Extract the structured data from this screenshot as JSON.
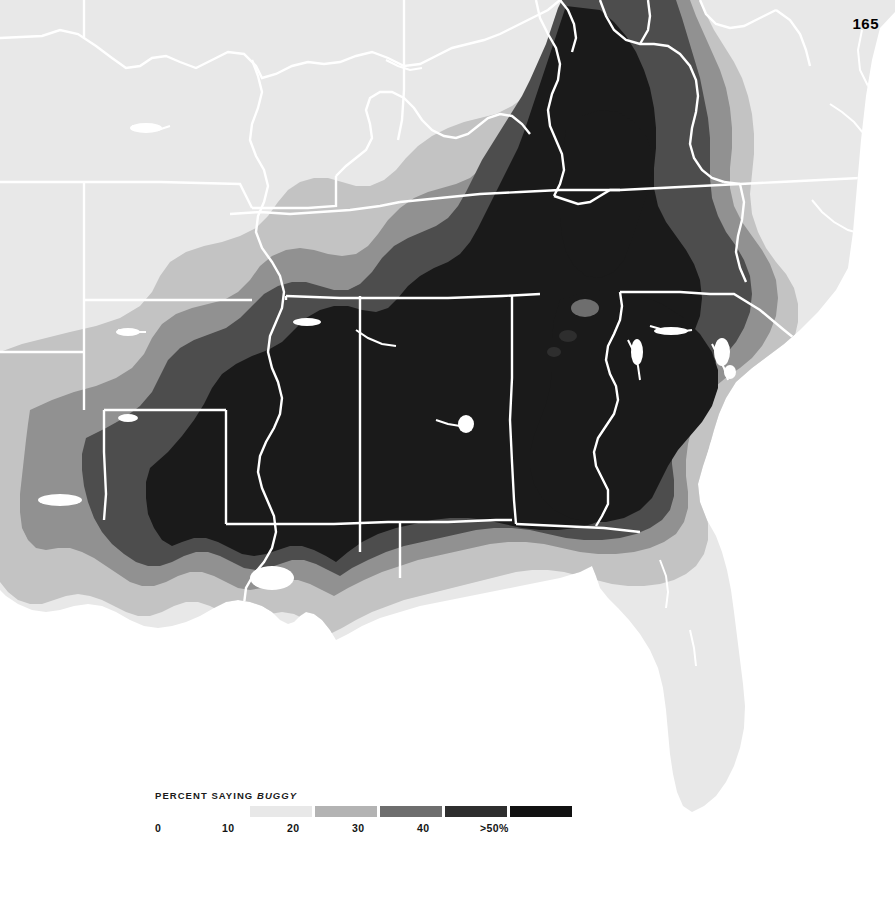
{
  "page": {
    "number": "165",
    "background_color": "#ffffff"
  },
  "map": {
    "name": "percent-saying-buggy-choropleth",
    "region": "Southeastern United States",
    "water_color": "#ffffff",
    "border_color": "#ffffff",
    "projection_note": "conic",
    "state_borders_visible": true
  },
  "legend": {
    "title_prefix": "PERCENT SAYING ",
    "title_keyword": "BUGGY",
    "title_full": "PERCENT SAYING BUGGY",
    "ticks": [
      {
        "label": "0",
        "x": 0
      },
      {
        "label": "10",
        "x": 67
      },
      {
        "label": "20",
        "x": 132
      },
      {
        "label": "30",
        "x": 197
      },
      {
        "label": "40",
        "x": 262
      },
      {
        "label": ">50%",
        "x": 325
      }
    ],
    "swatches": [
      {
        "label": "0-10",
        "color": "#e8e8e8"
      },
      {
        "label": "10-20",
        "color": "#b3b3b3"
      },
      {
        "label": "20-30",
        "color": "#6e6e6e"
      },
      {
        "label": "30-40",
        "color": "#2e2e2e"
      },
      {
        "label": ">50%",
        "color": "#111111"
      }
    ]
  },
  "chart_data": {
    "type": "heatmap",
    "title": "PERCENT SAYING BUGGY",
    "subtitle": "",
    "xlabel": "",
    "ylabel": "",
    "legend_position": "bottom-left",
    "grid": false,
    "units": "percent of respondents",
    "bins": [
      {
        "range": "0-10",
        "color": "#e8e8e8",
        "min": 0,
        "max": 10
      },
      {
        "range": "10-20",
        "color": "#b3b3b3",
        "min": 10,
        "max": 20
      },
      {
        "range": "20-30",
        "color": "#6e6e6e",
        "min": 20,
        "max": 30
      },
      {
        "range": "30-40",
        "color": "#2e2e2e",
        "min": 30,
        "max": 40
      },
      {
        "range": ">50",
        "color": "#111111",
        "min": 50,
        "max": 100
      }
    ],
    "categories": [
      "Central Alabama",
      "Central Mississippi",
      "Southern Louisiana",
      "Northern Georgia",
      "Eastern Tennessee",
      "Upstate South Carolina",
      "Southwest Virginia",
      "Central Tennessee",
      "Northern Mississippi",
      "Eastern Arkansas",
      "Western Arkansas",
      "Eastern Texas",
      "Central North Carolina",
      "Coastal North Carolina",
      "Northern Florida",
      "Peninsular Florida",
      "Central Virginia",
      "Missouri",
      "Oklahoma",
      "Kansas",
      "Kentucky (Bluegrass)",
      "Southern Illinois"
    ],
    "values": [
      62,
      58,
      55,
      52,
      48,
      52,
      44,
      45,
      42,
      35,
      22,
      16,
      24,
      14,
      22,
      6,
      10,
      5,
      7,
      4,
      18,
      8
    ],
    "annotations": [
      "Darkest core (>50%) spans Alabama, Mississippi, south Louisiana, north Georgia, east Tennessee and upstate South Carolina.",
      "Values fall off in concentric bands outward toward Texas, Oklahoma, Missouri and Virginia.",
      "Peninsular Florida is in the lowest band (0-10%)."
    ]
  }
}
